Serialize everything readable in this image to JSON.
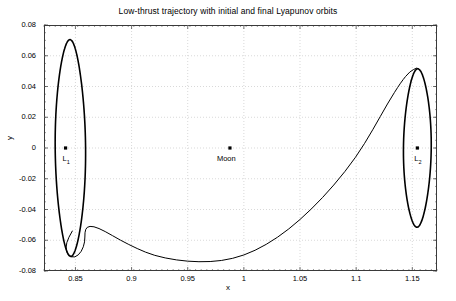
{
  "figure": {
    "title": "Low-thrust trajectory with initial and final Lyapunov orbits",
    "xlabel": "x",
    "ylabel": "y",
    "background_color": "#ffffff",
    "axes_color": "#3a3a3a",
    "grid_color": "#c8c8c8",
    "curve_color": "#000000"
  },
  "chart_data": {
    "type": "line",
    "title": "Low-thrust trajectory with initial and final Lyapunov orbits",
    "xlabel": "x",
    "ylabel": "y",
    "xlim": [
      0.822,
      1.172
    ],
    "ylim": [
      -0.08,
      0.08
    ],
    "xticks": [
      0.85,
      0.9,
      0.95,
      1,
      1.05,
      1.1,
      1.15
    ],
    "xtick_labels": [
      "0.85",
      "0.9",
      "0.95",
      "1",
      "1.05",
      "1.1",
      "1.15"
    ],
    "yticks": [
      -0.08,
      -0.06,
      -0.04,
      -0.02,
      0,
      0.02,
      0.04,
      0.06,
      0.08
    ],
    "ytick_labels": [
      "-0.08",
      "-0.06",
      "-0.04",
      "-0.02",
      "0",
      "0.02",
      "0.04",
      "0.06",
      "0.08"
    ],
    "grid": true,
    "grid_style": "dotted",
    "legend": null,
    "series": [
      {
        "name": "initial Lyapunov orbit (L1)",
        "kind": "closed-orbit",
        "center": [
          0.8455,
          0.0
        ],
        "semi_x": 0.0115,
        "semi_y": 0.0705,
        "tilt_deg": -3.0,
        "linewidth": 1.6
      },
      {
        "name": "final Lyapunov orbit (L2)",
        "kind": "closed-orbit",
        "center": [
          1.1545,
          0.0
        ],
        "semi_x": 0.0105,
        "semi_y": 0.0515,
        "tilt_deg": 2.0,
        "linewidth": 1.6
      },
      {
        "name": "low-thrust transfer trajectory",
        "kind": "transfer-arc",
        "linewidth": 1.0,
        "points": [
          [
            0.8472,
            -0.054
          ],
          [
            0.8435,
            -0.0585
          ],
          [
            0.8412,
            -0.0645
          ],
          [
            0.8432,
            -0.07
          ],
          [
            0.8495,
            -0.0715
          ],
          [
            0.8555,
            -0.0675
          ],
          [
            0.8585,
            -0.061
          ],
          [
            0.8583,
            -0.0548
          ],
          [
            0.86,
            -0.0512
          ],
          [
            0.866,
            -0.0508
          ],
          [
            0.876,
            -0.054
          ],
          [
            0.89,
            -0.06
          ],
          [
            0.905,
            -0.0655
          ],
          [
            0.92,
            -0.07
          ],
          [
            0.94,
            -0.073
          ],
          [
            0.96,
            -0.0742
          ],
          [
            0.98,
            -0.0735
          ],
          [
            1.0,
            -0.07
          ],
          [
            1.02,
            -0.063
          ],
          [
            1.04,
            -0.053
          ],
          [
            1.06,
            -0.04
          ],
          [
            1.08,
            -0.0245
          ],
          [
            1.1,
            -0.006
          ],
          [
            1.115,
            0.012
          ],
          [
            1.128,
            0.029
          ],
          [
            1.14,
            0.043
          ],
          [
            1.148,
            0.05
          ],
          [
            1.154,
            0.052
          ]
        ]
      }
    ],
    "markers": [
      {
        "label": "L1",
        "label_html": "L<sub>1</sub>",
        "x": 0.8412,
        "y": 0.0,
        "marker": "square"
      },
      {
        "label": "Moon",
        "label_html": "Moon",
        "x": 0.9876,
        "y": 0.0,
        "marker": "square"
      },
      {
        "label": "L2",
        "label_html": "L<sub>2</sub>",
        "x": 1.1545,
        "y": 0.0,
        "marker": "square"
      }
    ]
  }
}
